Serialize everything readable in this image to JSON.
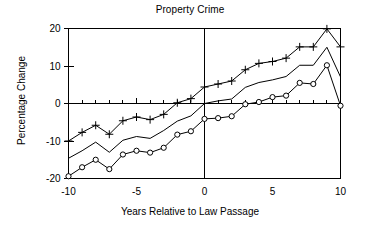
{
  "chart_data": {
    "type": "line",
    "title": "Property Crime",
    "xlabel": "Years Relative to Law Passage",
    "ylabel": "Percentage Change",
    "xlim": [
      -10,
      10
    ],
    "ylim": [
      -20,
      20
    ],
    "xticks": [
      -10,
      -9,
      -8,
      -7,
      -6,
      -5,
      -4,
      -3,
      -2,
      -1,
      0,
      1,
      2,
      3,
      4,
      5,
      6,
      7,
      8,
      9,
      10
    ],
    "xtick_labels_shown": [
      "-10",
      "-5",
      "0",
      "5",
      "10"
    ],
    "xtick_label_values": [
      -10,
      -5,
      0,
      5,
      10
    ],
    "yticks": [
      -20,
      -10,
      0,
      10,
      20
    ],
    "ytick_labels_shown": [
      "-20",
      "-10",
      "0",
      "10",
      "20"
    ],
    "grid": false,
    "legend": "none",
    "zero_reference_lines": {
      "vertical_x": 0,
      "horizontal_y": 0
    },
    "x": [
      -10,
      -9,
      -8,
      -7,
      -6,
      -5,
      -4,
      -3,
      -2,
      -1,
      0,
      1,
      2,
      3,
      4,
      5,
      6,
      7,
      8,
      9,
      10
    ],
    "series": [
      {
        "name": "Upper bound",
        "marker": "plus",
        "values": [
          -10.0,
          -7.7,
          -5.8,
          -8.2,
          -4.6,
          -3.6,
          -4.3,
          -2.9,
          0.2,
          1.3,
          4.4,
          5.2,
          6.0,
          9.0,
          10.7,
          11.2,
          12.1,
          15.1,
          15.1,
          19.9,
          15.1
        ]
      },
      {
        "name": "Point estimate",
        "marker": "none",
        "values": [
          -14.6,
          -12.6,
          -10.3,
          -13.0,
          -9.8,
          -8.8,
          -9.3,
          -7.2,
          -4.7,
          -3.3,
          0.0,
          0.7,
          1.2,
          4.3,
          5.6,
          6.3,
          7.2,
          10.2,
          10.2,
          15.0,
          7.1
        ]
      },
      {
        "name": "Lower bound",
        "marker": "circle",
        "values": [
          -19.4,
          -17.0,
          -15.0,
          -17.5,
          -13.6,
          -12.6,
          -13.1,
          -11.8,
          -8.3,
          -7.4,
          -4.1,
          -3.9,
          -3.4,
          -0.2,
          0.4,
          1.7,
          2.1,
          5.5,
          5.2,
          10.2,
          -0.6
        ]
      }
    ]
  }
}
